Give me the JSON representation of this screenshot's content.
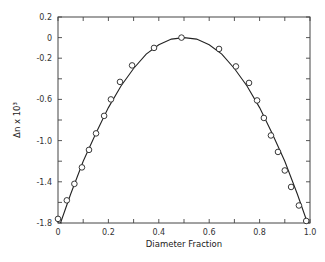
{
  "chart_data": {
    "type": "scatter",
    "title": "",
    "xlabel": "Diameter Fraction",
    "ylabel": "Δn x 10³",
    "xlim": [
      0,
      1.0
    ],
    "ylim": [
      -1.8,
      0.2
    ],
    "grid": false,
    "legend": null,
    "x_ticks": [
      0,
      0.1,
      0.2,
      0.3,
      0.4,
      0.5,
      0.6,
      0.7,
      0.8,
      0.9,
      1.0
    ],
    "x_tick_labels": [
      "0",
      "0.2",
      "0.4",
      "0.6",
      "0.8",
      "1.0"
    ],
    "x_tick_label_values": [
      0,
      0.2,
      0.4,
      0.6,
      0.8,
      1.0
    ],
    "y_ticks": [
      0.2,
      0.0,
      -0.2,
      -0.4,
      -0.6,
      -0.8,
      -1.0,
      -1.2,
      -1.4,
      -1.6,
      -1.8
    ],
    "y_tick_labels": [
      "0.2",
      "0",
      "-0.2",
      "-0.6",
      "-1.0",
      "-1.4",
      "-1.8"
    ],
    "y_tick_label_values": [
      0.2,
      0.0,
      -0.2,
      -0.6,
      -1.0,
      -1.4,
      -1.8
    ],
    "series": [
      {
        "name": "measured",
        "marker": "open-circle",
        "x": [
          0.0,
          0.035,
          0.065,
          0.095,
          0.123,
          0.151,
          0.183,
          0.21,
          0.246,
          0.294,
          0.381,
          0.49,
          0.639,
          0.706,
          0.758,
          0.79,
          0.817,
          0.845,
          0.873,
          0.9,
          0.925,
          0.956,
          0.985
        ],
        "y": [
          -1.76,
          -1.58,
          -1.42,
          -1.26,
          -1.09,
          -0.93,
          -0.76,
          -0.6,
          -0.43,
          -0.27,
          -0.1,
          0.0,
          -0.11,
          -0.28,
          -0.44,
          -0.61,
          -0.78,
          -0.95,
          -1.11,
          -1.29,
          -1.45,
          -1.63,
          -1.78
        ]
      },
      {
        "name": "fit",
        "style": "solid-line",
        "x": [
          0.01,
          0.05,
          0.1,
          0.15,
          0.2,
          0.25,
          0.3,
          0.35,
          0.4,
          0.45,
          0.5,
          0.55,
          0.6,
          0.65,
          0.7,
          0.75,
          0.8,
          0.85,
          0.9,
          0.95,
          0.99
        ],
        "y": [
          -1.8,
          -1.52,
          -1.2,
          -0.93,
          -0.68,
          -0.47,
          -0.3,
          -0.16,
          -0.07,
          -0.015,
          0.0,
          -0.015,
          -0.07,
          -0.16,
          -0.3,
          -0.47,
          -0.68,
          -0.93,
          -1.2,
          -1.52,
          -1.8
        ]
      }
    ]
  }
}
